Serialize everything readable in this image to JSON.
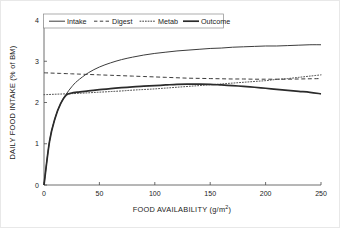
{
  "chart_data": {
    "type": "line",
    "title": "",
    "xlabel": "FOOD AVAILABILITY (g/m2)",
    "xlabel_main": "FOOD AVAILABILITY (g/m",
    "xlabel_sup": "2",
    "xlabel_tail": ")",
    "ylabel": "DAILY FOOD INTAKE (% of BM)",
    "xlim": [
      0,
      250
    ],
    "ylim": [
      0,
      4
    ],
    "xticks": [
      0,
      50,
      100,
      150,
      200,
      250
    ],
    "yticks": [
      0,
      1,
      2,
      3,
      4
    ],
    "xtick_labels": [
      "0",
      "50",
      "100",
      "150",
      "200",
      "250"
    ],
    "ytick_labels": [
      "0",
      "1",
      "2",
      "3",
      "4"
    ],
    "grid": false,
    "legend_position": "top-center",
    "x": [
      0,
      5,
      10,
      15,
      20,
      25,
      30,
      40,
      50,
      60,
      70,
      80,
      90,
      100,
      110,
      120,
      130,
      140,
      150,
      160,
      170,
      180,
      190,
      200,
      210,
      220,
      230,
      240,
      250
    ],
    "series": [
      {
        "name": "Intake",
        "style": "solid",
        "color": "#3c3c3c",
        "values": [
          0.0,
          1.06,
          1.62,
          1.97,
          2.2,
          2.38,
          2.52,
          2.72,
          2.86,
          2.96,
          3.04,
          3.1,
          3.15,
          3.19,
          3.22,
          3.25,
          3.27,
          3.29,
          3.31,
          3.32,
          3.34,
          3.35,
          3.36,
          3.37,
          3.37,
          3.38,
          3.39,
          3.4,
          3.4
        ]
      },
      {
        "name": "Digest",
        "style": "dashed",
        "color": "#3c3c3c",
        "values": [
          2.72,
          2.715,
          2.71,
          2.705,
          2.7,
          2.695,
          2.69,
          2.68,
          2.67,
          2.66,
          2.65,
          2.64,
          2.63,
          2.62,
          2.61,
          2.6,
          2.59,
          2.585,
          2.58,
          2.575,
          2.57,
          2.57,
          2.565,
          2.565,
          2.565,
          2.565,
          2.57,
          2.575,
          2.58
        ]
      },
      {
        "name": "Metab",
        "style": "dotted",
        "color": "#3c3c3c",
        "values": [
          2.19,
          2.195,
          2.2,
          2.205,
          2.21,
          2.215,
          2.22,
          2.235,
          2.25,
          2.265,
          2.28,
          2.3,
          2.315,
          2.33,
          2.35,
          2.37,
          2.39,
          2.41,
          2.43,
          2.45,
          2.47,
          2.49,
          2.51,
          2.53,
          2.56,
          2.58,
          2.61,
          2.64,
          2.67
        ]
      },
      {
        "name": "Outcome",
        "style": "thick-solid",
        "color": "#2b2b2b",
        "values": [
          0.0,
          1.06,
          1.62,
          1.97,
          2.18,
          2.23,
          2.25,
          2.28,
          2.31,
          2.335,
          2.36,
          2.38,
          2.395,
          2.41,
          2.425,
          2.44,
          2.445,
          2.445,
          2.44,
          2.425,
          2.41,
          2.39,
          2.37,
          2.345,
          2.32,
          2.295,
          2.27,
          2.245,
          2.21
        ]
      }
    ]
  },
  "legend": {
    "items": [
      {
        "label": "Intake"
      },
      {
        "label": "Digest"
      },
      {
        "label": "Metab"
      },
      {
        "label": "Outcome"
      }
    ]
  }
}
